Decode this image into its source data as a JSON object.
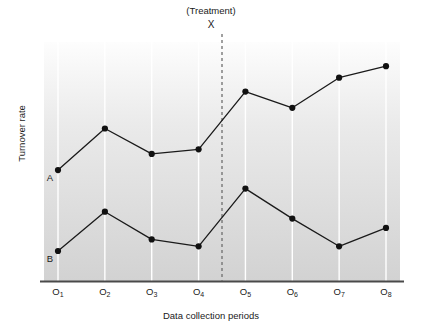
{
  "chart_data": {
    "type": "line",
    "title": "",
    "xlabel": "Data collection periods",
    "ylabel": "Turnover rate",
    "categories": [
      "O1",
      "O2",
      "O3",
      "O4",
      "O5",
      "O6",
      "O7",
      "O8"
    ],
    "tick_labels": [
      "O",
      "O",
      "O",
      "O",
      "O",
      "O",
      "O",
      "O"
    ],
    "tick_subscripts": [
      "1",
      "2",
      "3",
      "4",
      "5",
      "6",
      "7",
      "8"
    ],
    "grid": "vertical-only",
    "legend_position": "inline-left",
    "ylim": [
      0,
      100
    ],
    "xlim": [
      0.5,
      8.5
    ],
    "series": [
      {
        "name": "A",
        "label": "A",
        "values": [
          48,
          66,
          55,
          57,
          82,
          75,
          88,
          93
        ],
        "color": "#1a1a1a"
      },
      {
        "name": "B",
        "label": "B",
        "values": [
          13,
          30,
          18,
          15,
          40,
          27,
          15,
          23
        ],
        "color": "#1a1a1a"
      }
    ],
    "annotations": [
      {
        "name": "treatment-marker",
        "caption": "(Treatment)",
        "symbol": "X",
        "x_position": 4.5,
        "style": "dashed-vertical-line"
      }
    ],
    "colors": {
      "line": "#1a1a1a",
      "marker": "#111111",
      "axis": "#4a4a4a",
      "gridline": "#ffffff",
      "plot_background_top": "#fdfdfd",
      "plot_background_bottom": "#d2d2d2",
      "treatment_line": "#6e6e6e"
    }
  },
  "axis_titles": {
    "y": "Turnover rate",
    "x": "Data collection periods"
  },
  "treatment": {
    "caption": "(Treatment)",
    "symbol": "X"
  }
}
